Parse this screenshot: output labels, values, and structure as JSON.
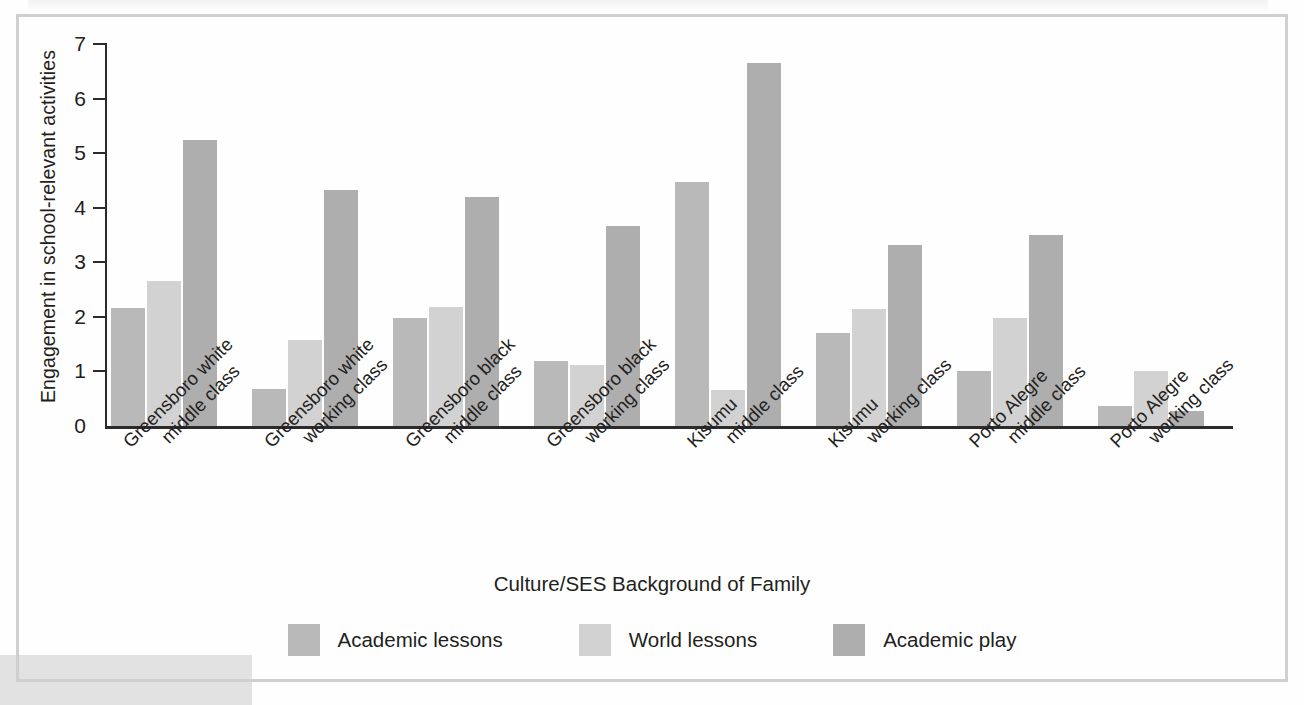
{
  "figure": {
    "frame_color": "#cfcfcf",
    "background": "#ffffff"
  },
  "chart_data": {
    "type": "bar",
    "title": "",
    "xlabel": "Culture/SES Background of Family",
    "ylabel": "Engagement in school-relevant activities",
    "ylim": [
      0,
      7
    ],
    "yticks": [
      "0",
      "1",
      "2",
      "3",
      "4",
      "5",
      "6",
      "7"
    ],
    "grid": false,
    "legend_position": "bottom-center",
    "categories": [
      "Greensboro white middle class",
      "Greensboro white working class",
      "Greensboro black middle class",
      "Greensboro black working class",
      "Kisumu middle class",
      "Kisumu working class",
      "Porto Alegre middle class",
      "Porto Alegre working class"
    ],
    "category_lines": [
      [
        "Greensboro white",
        "middle class"
      ],
      [
        "Greensboro white",
        "working class"
      ],
      [
        "Greensboro black",
        "middle class"
      ],
      [
        "Greensboro black",
        "working class"
      ],
      [
        "Kisumu",
        "middle class"
      ],
      [
        "Kisumu",
        "working class"
      ],
      [
        "Porto Alegre",
        "middle class"
      ],
      [
        "Porto Alegre",
        "working class"
      ]
    ],
    "series": [
      {
        "name": "Academic lessons",
        "color": "#b9b9b9",
        "values": [
          2.17,
          0.68,
          1.98,
          1.2,
          4.48,
          1.71,
          1.0,
          0.37
        ]
      },
      {
        "name": "World lessons",
        "color": "#d2d2d2",
        "values": [
          2.65,
          1.57,
          2.18,
          1.12,
          0.66,
          2.15,
          1.98,
          1.0
        ]
      },
      {
        "name": "Academic play",
        "color": "#aeaeae",
        "values": [
          5.25,
          4.32,
          4.2,
          3.67,
          6.65,
          3.32,
          3.5,
          0.27
        ]
      }
    ]
  }
}
